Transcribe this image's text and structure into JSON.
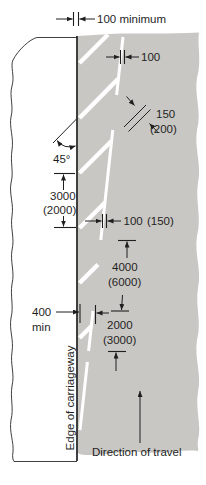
{
  "diagram": {
    "annotations": {
      "top_gap": "100 minimum",
      "taper_line_width_top": "100",
      "diagonal_width": "150",
      "diagonal_width_alt": "(200)",
      "diagonal_angle": "45°",
      "diagonal_spacing": "3000",
      "diagonal_spacing_alt": "(2000)",
      "taper_line_width": "100",
      "taper_line_width_alt": "(150)",
      "gap_length": "4000",
      "gap_length_alt": "(6000)",
      "edge_clearance": "400",
      "edge_clearance_suffix": "min",
      "mark_length": "2000",
      "mark_length_alt": "(3000)",
      "edge_of_carriageway": "Edge of carriageway",
      "direction_of_travel": "Direction of travel"
    },
    "colors": {
      "carriageway": "#c9c7c3",
      "road_marking": "#ffffff",
      "ink": "#1f1f1f",
      "verge": "#ffffff"
    }
  }
}
